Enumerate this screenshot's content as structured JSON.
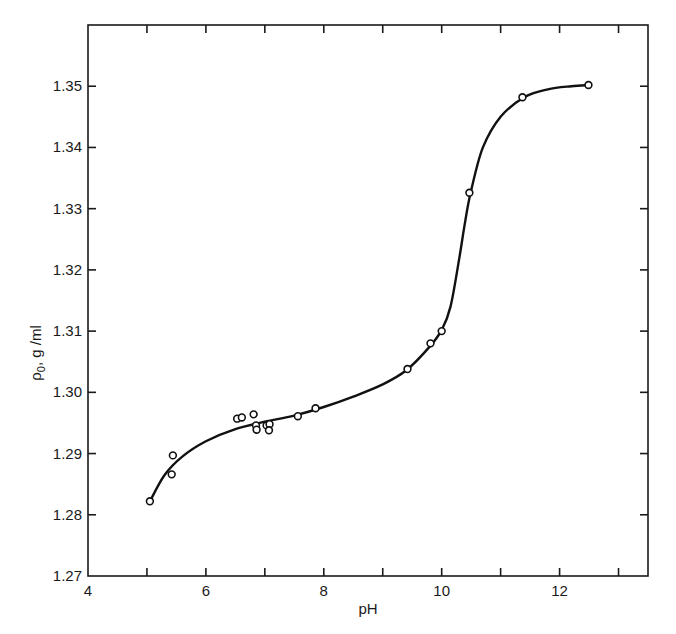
{
  "chart_data": {
    "type": "scatter",
    "title": "",
    "xlabel": "pH",
    "ylabel": "ρ0, g/ml",
    "ylabel_main": "ρ",
    "ylabel_sub": "0",
    "ylabel_rest": ", g /ml",
    "xlim": [
      4,
      13.5
    ],
    "ylim": [
      1.27,
      1.36
    ],
    "x_ticks": [
      4,
      5,
      6,
      7,
      8,
      9,
      10,
      11,
      12,
      13
    ],
    "x_tick_labels": [
      "4",
      "6",
      "8",
      "10",
      "12"
    ],
    "x_tick_label_values": [
      4,
      6,
      8,
      10,
      12
    ],
    "y_ticks": [
      1.27,
      1.28,
      1.29,
      1.3,
      1.31,
      1.32,
      1.33,
      1.34,
      1.35
    ],
    "y_tick_labels": [
      "1.27",
      "1.28",
      "1.29",
      "1.30",
      "1.31",
      "1.32",
      "1.33",
      "1.34",
      "1.35"
    ],
    "grid": false,
    "legend": null,
    "series": [
      {
        "name": "measured",
        "style": "open-circle",
        "x": [
          5.05,
          5.42,
          5.44,
          6.53,
          6.61,
          6.81,
          6.85,
          6.86,
          7.03,
          7.08,
          7.07,
          7.56,
          7.86,
          9.42,
          9.81,
          10.0,
          10.47,
          11.37,
          12.49
        ],
        "y": [
          1.2822,
          1.2866,
          1.2897,
          1.2957,
          1.2959,
          1.2964,
          1.2946,
          1.2939,
          1.2946,
          1.2948,
          1.2938,
          1.2961,
          1.2974,
          1.3038,
          1.308,
          1.31,
          1.3326,
          1.3482,
          1.3502
        ]
      },
      {
        "name": "fitted curve",
        "style": "smooth-line",
        "x": [
          5.05,
          5.3,
          5.6,
          6.0,
          6.5,
          7.0,
          7.5,
          8.0,
          8.5,
          9.0,
          9.4,
          9.8,
          10.0,
          10.15,
          10.3,
          10.4,
          10.5,
          10.7,
          11.0,
          11.4,
          11.8,
          12.2,
          12.5
        ],
        "y": [
          1.2822,
          1.2865,
          1.2895,
          1.292,
          1.294,
          1.2952,
          1.2962,
          1.2976,
          1.2993,
          1.3013,
          1.3036,
          1.3075,
          1.3102,
          1.314,
          1.322,
          1.328,
          1.333,
          1.34,
          1.345,
          1.3482,
          1.3495,
          1.35,
          1.3502
        ]
      }
    ]
  }
}
